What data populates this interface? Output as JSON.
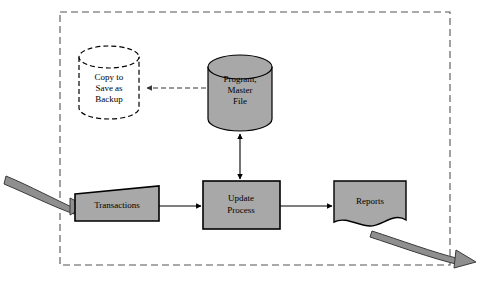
{
  "diagram": {
    "type": "system-flowchart",
    "canvas": {
      "width": 488,
      "height": 284,
      "background": "#ffffff"
    },
    "colors": {
      "shape_fill": "#a8a8a8",
      "shape_stroke": "#000000",
      "backup_fill": "#ffffff",
      "boundary_stroke": "#555555",
      "ribbon_fill": "#8f8f8f",
      "ribbon_stroke": "#3a3a3a",
      "connector_stroke": "#000000",
      "dashed_connector_stroke": "#555555"
    },
    "boundary": {
      "name": "system-boundary",
      "style": "dashed",
      "x": 60,
      "y": 12,
      "width": 390,
      "height": 253
    },
    "nodes": [
      {
        "id": "backup",
        "shape": "cylinder",
        "style": "dashed",
        "fill": "white",
        "label_lines": [
          "Copy to",
          "Save as",
          "Backup"
        ],
        "x": 79,
        "y": 45,
        "width": 60,
        "height": 75
      },
      {
        "id": "master_file",
        "shape": "cylinder",
        "style": "solid",
        "fill": "gray",
        "label_lines": [
          "Program,",
          "Master",
          "File"
        ],
        "x": 208,
        "y": 55,
        "width": 64,
        "height": 76
      },
      {
        "id": "transactions",
        "shape": "trapezoid-manual-input",
        "style": "solid",
        "fill": "gray",
        "label_lines": [
          "Transactions"
        ],
        "x": 75,
        "y": 186,
        "width": 84,
        "height": 35
      },
      {
        "id": "update_process",
        "shape": "rectangle-process",
        "style": "solid",
        "fill": "gray",
        "label_lines": [
          "Update",
          "Process"
        ],
        "x": 203,
        "y": 181,
        "width": 77,
        "height": 48
      },
      {
        "id": "reports",
        "shape": "document-wavy-bottom",
        "style": "solid",
        "fill": "gray",
        "label_lines": [
          "Reports"
        ],
        "x": 334,
        "y": 181,
        "width": 72,
        "height": 48
      }
    ],
    "connectors": [
      {
        "id": "master-to-backup",
        "from": "master_file",
        "to": "backup",
        "style": "dashed",
        "arrowheads": "end",
        "orientation": "horizontal"
      },
      {
        "id": "master-to-update",
        "from": "master_file",
        "to": "update_process",
        "style": "solid",
        "arrowheads": "both",
        "orientation": "vertical"
      },
      {
        "id": "transactions-to-update",
        "from": "transactions",
        "to": "update_process",
        "style": "solid",
        "arrowheads": "end",
        "orientation": "horizontal"
      },
      {
        "id": "update-to-reports",
        "from": "update_process",
        "to": "reports",
        "style": "solid",
        "arrowheads": "end",
        "orientation": "horizontal"
      },
      {
        "id": "input-ribbon",
        "from": "external-input",
        "to": "transactions",
        "style": "curved-ribbon",
        "arrowheads": "end"
      },
      {
        "id": "output-ribbon",
        "from": "reports",
        "to": "external-output",
        "style": "curved-ribbon",
        "arrowheads": "end"
      }
    ]
  }
}
